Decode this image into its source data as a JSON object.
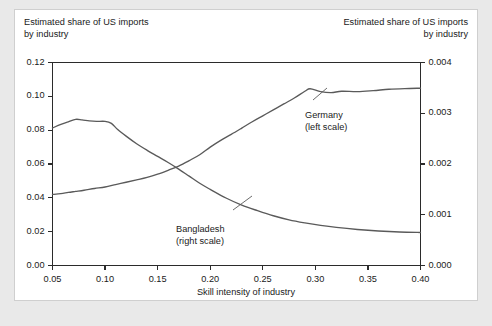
{
  "figure": {
    "left_axis_title": "Estimated share of US imports\nby industry",
    "right_axis_title": "Estimated share of US imports\nby industry",
    "x_axis_title": "Skill intensity of industry"
  },
  "chart_data": {
    "type": "line",
    "title": "",
    "subtitle": "",
    "xlabel": "Skill intensity of industry",
    "ylabel": "Estimated share of US imports by industry",
    "y2label": "Estimated share of US imports by industry",
    "xlim": [
      0.05,
      0.4
    ],
    "ylim": [
      0.0,
      0.12
    ],
    "y2lim": [
      0.0,
      0.004
    ],
    "xticks": [
      "0.05",
      "0.10",
      "0.15",
      "0.20",
      "0.25",
      "0.30",
      "0.35",
      "0.40"
    ],
    "xtick_values": [
      0.05,
      0.1,
      0.15,
      0.2,
      0.25,
      0.3,
      0.35,
      0.4
    ],
    "yticks": [
      "0.00",
      "0.02",
      "0.04",
      "0.06",
      "0.08",
      "0.10",
      "0.12"
    ],
    "ytick_values": [
      0.0,
      0.02,
      0.04,
      0.06,
      0.08,
      0.1,
      0.12
    ],
    "y2ticks": [
      "0.000",
      "0.001",
      "0.002",
      "0.003",
      "0.004"
    ],
    "y2tick_values": [
      0.0,
      0.001,
      0.002,
      0.003,
      0.004
    ],
    "grid": false,
    "legend_position": "inline-annotations",
    "line_color": "#5a5a5a",
    "series": [
      {
        "name": "Bangladesh",
        "axis": "right",
        "annotation": "Bangladesh\n(right scale)",
        "x": [
          0.05,
          0.058,
          0.065,
          0.072,
          0.078,
          0.085,
          0.092,
          0.1,
          0.106,
          0.112,
          0.12,
          0.13,
          0.14,
          0.15,
          0.16,
          0.17,
          0.18,
          0.19,
          0.2,
          0.215,
          0.23,
          0.245,
          0.26,
          0.275,
          0.29,
          0.305,
          0.32,
          0.34,
          0.36,
          0.38,
          0.4
        ],
        "values": [
          0.00271,
          0.00278,
          0.00283,
          0.00288,
          0.00287,
          0.00285,
          0.00284,
          0.00284,
          0.0028,
          0.00268,
          0.00255,
          0.0024,
          0.00227,
          0.00215,
          0.00203,
          0.0019,
          0.00176,
          0.00162,
          0.0015,
          0.00133,
          0.00119,
          0.00108,
          0.00098,
          0.0009,
          0.00084,
          0.00079,
          0.00075,
          0.00071,
          0.00068,
          0.00066,
          0.00065
        ]
      },
      {
        "name": "Germany",
        "axis": "left",
        "annotation": "Germany\n(left scale)",
        "x": [
          0.05,
          0.058,
          0.065,
          0.072,
          0.08,
          0.09,
          0.1,
          0.11,
          0.12,
          0.13,
          0.14,
          0.15,
          0.16,
          0.17,
          0.18,
          0.19,
          0.2,
          0.21,
          0.22,
          0.23,
          0.24,
          0.25,
          0.26,
          0.27,
          0.28,
          0.29,
          0.295,
          0.305,
          0.315,
          0.325,
          0.34,
          0.355,
          0.37,
          0.385,
          0.4
        ],
        "values": [
          0.042,
          0.0425,
          0.0432,
          0.0438,
          0.0445,
          0.0455,
          0.0464,
          0.0478,
          0.0492,
          0.0506,
          0.0521,
          0.054,
          0.0563,
          0.0588,
          0.062,
          0.0655,
          0.07,
          0.074,
          0.0775,
          0.0812,
          0.085,
          0.0885,
          0.092,
          0.0955,
          0.099,
          0.103,
          0.1045,
          0.1028,
          0.1022,
          0.103,
          0.1028,
          0.1034,
          0.1042,
          0.1046,
          0.1048
        ]
      }
    ]
  }
}
